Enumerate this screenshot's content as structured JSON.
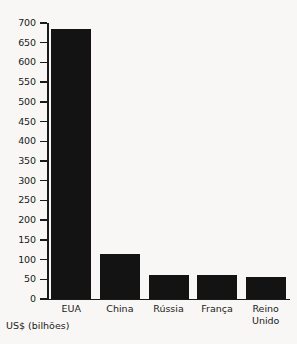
{
  "chart_data": {
    "type": "bar",
    "title": "",
    "subtitle": "",
    "xlabel": "",
    "ylabel": "US$ (bilhões)",
    "categories": [
      "EUA",
      "China",
      "Rússia",
      "França",
      "Reino\nUnido"
    ],
    "values": [
      685,
      115,
      61,
      61,
      55
    ],
    "series": [
      {
        "name": "Gastos militares",
        "values": [
          685,
          115,
          61,
          61,
          55
        ]
      }
    ],
    "ylim": [
      0,
      700
    ],
    "ytick_labels": [
      "700",
      "650",
      "600",
      "550",
      "500",
      "450",
      "400",
      "350",
      "300",
      "250",
      "200",
      "150",
      "100",
      "50",
      "0"
    ],
    "ytick_values": [
      700,
      650,
      600,
      550,
      500,
      450,
      400,
      350,
      300,
      250,
      200,
      150,
      100,
      50,
      0
    ],
    "ytick_step": 50,
    "grid": false,
    "legend": false,
    "legend_position": "none",
    "bar_color": "#131313",
    "background_color": "#f8f7f5",
    "axis_color": "#1a1a1a",
    "annotations": []
  },
  "caption": {
    "text": "US$ (bilhões)"
  }
}
